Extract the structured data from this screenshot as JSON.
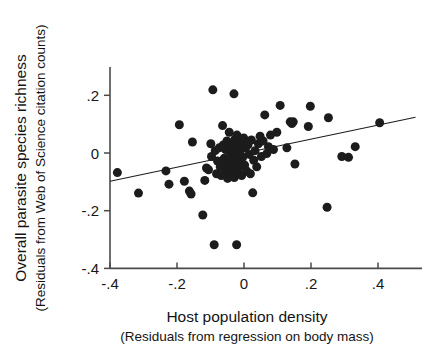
{
  "chart_data": {
    "type": "scatter",
    "title": "",
    "xlabel": "Host population density",
    "xlabel_sub": "(Residuals from regression on body mass)",
    "ylabel": "Overall parasite species richness",
    "ylabel_sub": "(Residuals from Web of Science citation counts)",
    "xlim": [
      -0.465,
      0.465
    ],
    "ylim": [
      -0.4,
      0.268
    ],
    "xticks": [
      -0.4,
      -0.2,
      0,
      0.2,
      0.4
    ],
    "xticklabels": [
      "-.4",
      "-.2",
      "0",
      ".2",
      ".4"
    ],
    "yticks": [
      0.2,
      0,
      -0.2,
      -0.4
    ],
    "yticklabels": [
      ".2",
      "0",
      "-.2",
      "-.4"
    ],
    "grid": false,
    "legend": "none",
    "marker_color": "#1c1c1c",
    "marker_size_px": 9,
    "axis_color": "#4a4a4a",
    "fit_line": {
      "type": "linear-regression",
      "x_start": -0.4,
      "y_start": -0.098,
      "x_end": 0.512,
      "y_end": 0.124,
      "color": "#1d1d1d"
    },
    "points": [
      [
        -0.378,
        -0.068
      ],
      [
        -0.315,
        -0.139
      ],
      [
        -0.233,
        -0.062
      ],
      [
        -0.224,
        -0.108
      ],
      [
        -0.193,
        0.098
      ],
      [
        -0.178,
        -0.098
      ],
      [
        -0.163,
        -0.132
      ],
      [
        -0.158,
        -0.142
      ],
      [
        -0.154,
        0.038
      ],
      [
        -0.123,
        -0.215
      ],
      [
        -0.117,
        -0.095
      ],
      [
        -0.112,
        -0.052
      ],
      [
        -0.106,
        -0.058
      ],
      [
        -0.099,
        0.032
      ],
      [
        -0.097,
        -0.012
      ],
      [
        -0.093,
        0.219
      ],
      [
        -0.089,
        -0.318
      ],
      [
        -0.086,
        0.008
      ],
      [
        -0.082,
        -0.072
      ],
      [
        -0.079,
        -0.028
      ],
      [
        -0.074,
        0.018
      ],
      [
        -0.071,
        -0.048
      ],
      [
        -0.068,
        -0.078
      ],
      [
        -0.064,
        0.095
      ],
      [
        -0.062,
        0.028
      ],
      [
        -0.059,
        -0.018
      ],
      [
        -0.057,
        -0.042
      ],
      [
        -0.055,
        0.012
      ],
      [
        -0.053,
        -0.065
      ],
      [
        -0.051,
        0.042
      ],
      [
        -0.049,
        -0.088
      ],
      [
        -0.047,
        0.022
      ],
      [
        -0.046,
        -0.032
      ],
      [
        -0.044,
        0.072
      ],
      [
        -0.042,
        -0.055
      ],
      [
        -0.041,
        0.002
      ],
      [
        -0.039,
        -0.072
      ],
      [
        -0.037,
        0.035
      ],
      [
        -0.036,
        -0.022
      ],
      [
        -0.034,
        -0.062
      ],
      [
        -0.033,
        0.015
      ],
      [
        -0.031,
        -0.045
      ],
      [
        -0.03,
        0.205
      ],
      [
        -0.029,
        -0.085
      ],
      [
        -0.027,
        0.048
      ],
      [
        -0.026,
        -0.035
      ],
      [
        -0.024,
        -0.005
      ],
      [
        -0.022,
        -0.318
      ],
      [
        -0.021,
        0.062
      ],
      [
        -0.019,
        -0.068
      ],
      [
        -0.017,
        0.025
      ],
      [
        -0.015,
        -0.052
      ],
      [
        -0.013,
        0.005
      ],
      [
        -0.011,
        -0.028
      ],
      [
        -0.009,
        0.038
      ],
      [
        -0.007,
        -0.078
      ],
      [
        -0.004,
        -0.015
      ],
      [
        -0.001,
        0.052
      ],
      [
        0.002,
        -0.042
      ],
      [
        0.005,
        0.018
      ],
      [
        0.008,
        -0.062
      ],
      [
        0.012,
        0.028
      ],
      [
        0.016,
        -0.005
      ],
      [
        0.019,
        -0.072
      ],
      [
        0.022,
        0.045
      ],
      [
        0.026,
        -0.138
      ],
      [
        0.029,
        -0.025
      ],
      [
        0.033,
        0.008
      ],
      [
        0.038,
        -0.048
      ],
      [
        0.043,
        0.032
      ],
      [
        0.048,
        0.058
      ],
      [
        0.052,
        -0.012
      ],
      [
        0.057,
        0.042
      ],
      [
        0.062,
        0.132
      ],
      [
        0.068,
        -0.002
      ],
      [
        0.073,
        0.022
      ],
      [
        0.079,
        0.062
      ],
      [
        0.088,
        0.012
      ],
      [
        0.098,
        0.072
      ],
      [
        0.108,
        0.165
      ],
      [
        0.128,
        0.018
      ],
      [
        0.138,
        0.108
      ],
      [
        0.143,
        0.102
      ],
      [
        0.147,
        0.108
      ],
      [
        0.152,
        -0.038
      ],
      [
        0.192,
        0.092
      ],
      [
        0.198,
        0.162
      ],
      [
        0.248,
        -0.188
      ],
      [
        0.252,
        0.122
      ],
      [
        0.292,
        -0.012
      ],
      [
        0.312,
        -0.015
      ],
      [
        0.332,
        0.022
      ],
      [
        0.405,
        0.105
      ]
    ]
  },
  "figure": {
    "background": "#ffffff"
  }
}
